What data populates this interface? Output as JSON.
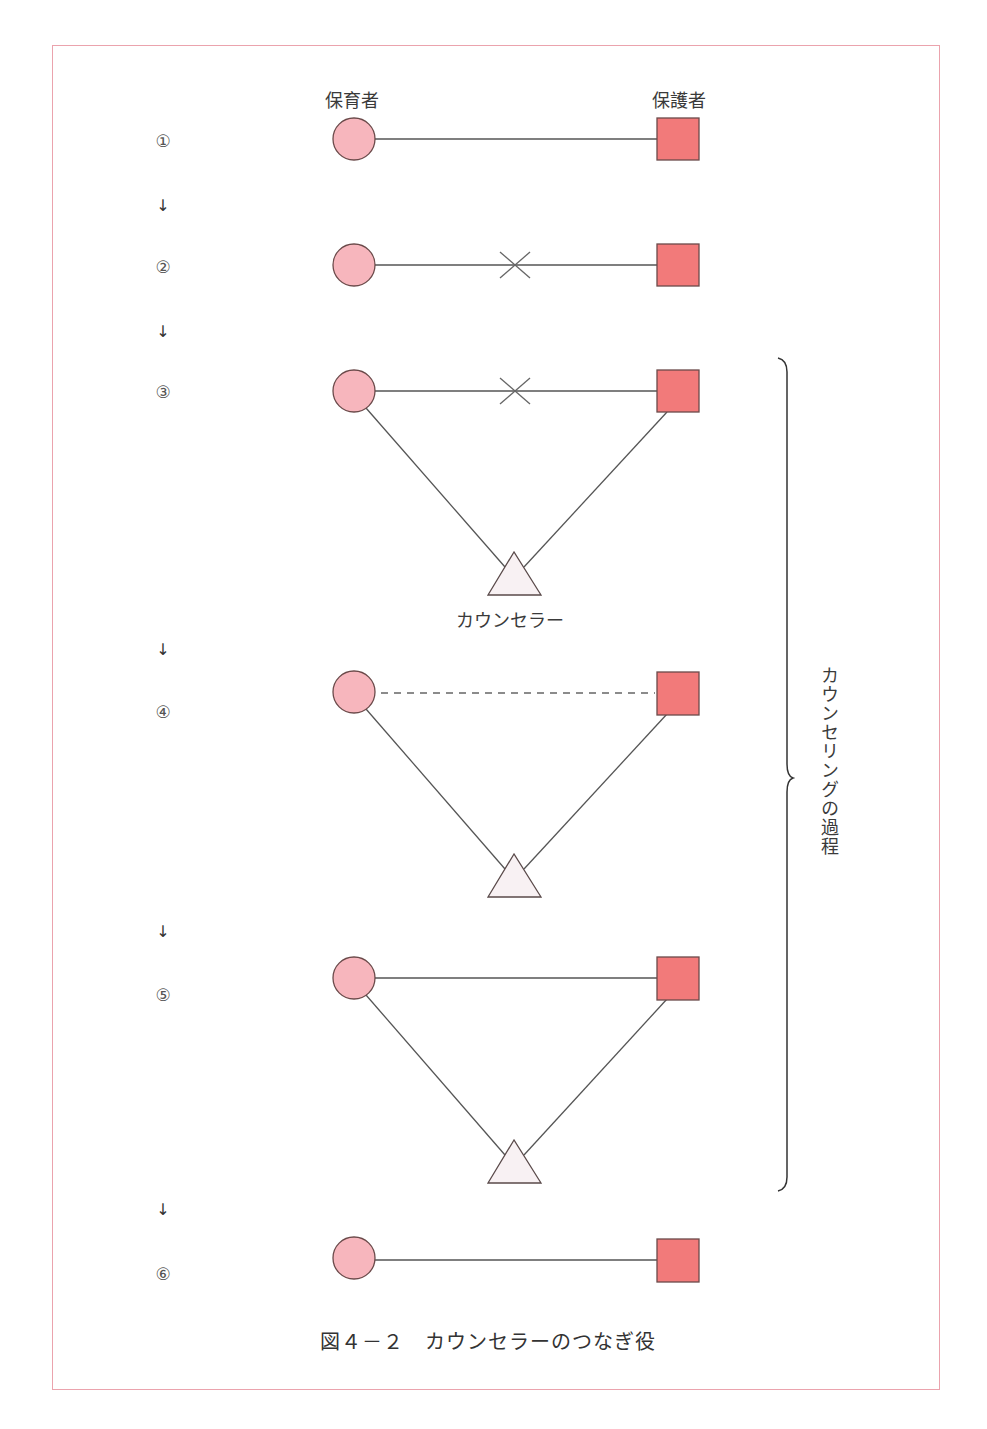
{
  "colors": {
    "frame_border": "#eba3ad",
    "circle_fill": "#f7b6bd",
    "square_fill": "#f27a7a",
    "triangle_fill": "#f8f1f3",
    "stroke": "#6b4a4a",
    "line": "#555555"
  },
  "labels": {
    "caregiver": "保育者",
    "guardian": "保護者",
    "counselor": "カウンセラー"
  },
  "steps": [
    {
      "number": "①",
      "connection": "solid"
    },
    {
      "number": "②",
      "connection": "broken-x"
    },
    {
      "number": "③",
      "connection": "broken-x",
      "via_counselor": true
    },
    {
      "number": "④",
      "connection": "dashed",
      "via_counselor": true
    },
    {
      "number": "⑤",
      "connection": "solid",
      "via_counselor": true
    },
    {
      "number": "⑥",
      "connection": "solid"
    }
  ],
  "arrow_glyph": "↓",
  "brace_label": "カウンセリングの過程",
  "caption": "図４－２　カウンセラーのつなぎ役"
}
